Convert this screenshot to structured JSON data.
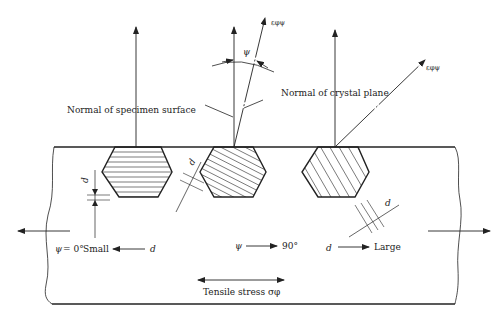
{
  "diagram": {
    "labels": {
      "normal_specimen": "Normal of specimen surface",
      "normal_crystal": "Normal of crystal plane",
      "psi_symbol": "ψ",
      "epsilon_label": "εφψ",
      "d": "d",
      "psi_zero": "ψ = 0°",
      "small": "Small",
      "psi": "ψ",
      "ninety": "90°",
      "large": "Large",
      "tensile_stress": "Tensile stress σφ"
    },
    "crystals": [
      {
        "name": "crystal-psi-0",
        "plane_orientation": "horizontal"
      },
      {
        "name": "crystal-psi-mid",
        "plane_orientation": "tilted"
      },
      {
        "name": "crystal-psi-large",
        "plane_orientation": "steep-tilted"
      }
    ],
    "colors": {
      "line": "#222222",
      "background": "#ffffff"
    }
  }
}
